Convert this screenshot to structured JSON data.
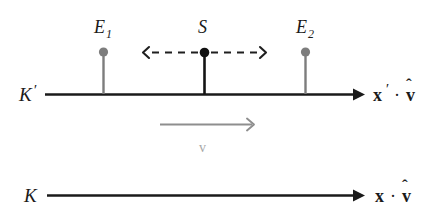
{
  "figure": {
    "kind": "physics-spacetime-frames-diagram",
    "background_color": "#ffffff",
    "width": 445,
    "height": 221
  },
  "colors": {
    "axis": "#1a1a1a",
    "event_marker": "#7d7d7d",
    "source_marker": "#111111",
    "signal_arrow": "#1f1f1f",
    "velocity_arrow": "#8e8e8e",
    "velocity_label": "#a8a8a8",
    "text": "#1a1a1a"
  },
  "frames": [
    {
      "id": "moving-frame",
      "label": "K",
      "prime": "′",
      "axis_label_base": "x",
      "axis_label_prime": "′",
      "axis_label_operator": "·",
      "axis_label_unit_vector": "v",
      "axis_label_hat": "ˆ",
      "axis_label_full": "x′ · v̂"
    },
    {
      "id": "rest-frame",
      "label": "K",
      "prime": "",
      "axis_label_base": "x",
      "axis_label_prime": "",
      "axis_label_operator": "·",
      "axis_label_unit_vector": "v",
      "axis_label_hat": "ˆ",
      "axis_label_full": "x · v̂"
    }
  ],
  "markers": [
    {
      "id": "event-1",
      "label": "E",
      "subscript": "1",
      "kind": "event",
      "color": "#7d7d7d"
    },
    {
      "id": "source",
      "label": "S",
      "subscript": "",
      "kind": "source",
      "color": "#111111"
    },
    {
      "id": "event-2",
      "label": "E",
      "subscript": "2",
      "kind": "event",
      "color": "#7d7d7d"
    }
  ],
  "signal": {
    "id": "light-signal",
    "style": "dashed",
    "direction": "bidirectional",
    "description": "dashed arrows emitted left and right from S"
  },
  "velocity": {
    "id": "frame-velocity",
    "label": "v",
    "direction": "right",
    "color": "#8e8e8e"
  }
}
